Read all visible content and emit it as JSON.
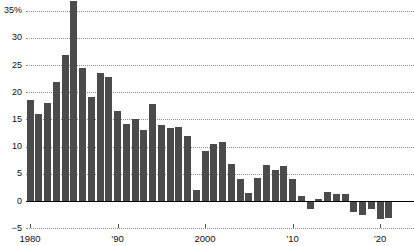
{
  "chart_data": {
    "type": "bar",
    "title": "",
    "subtitle": "",
    "xlabel": "",
    "ylabel": "",
    "ylim": [
      -5,
      36.8
    ],
    "xlim": [
      1979.3,
      2023.2
    ],
    "grid": true,
    "legend": null,
    "bar_color": "#4b4b4b",
    "zero_line_color": "#000000",
    "gridline_color": "#8d8d8d",
    "y_ticks": [
      -5,
      0,
      5,
      10,
      15,
      20,
      25,
      30,
      35
    ],
    "y_tick_labels": [
      "−5",
      "0",
      "5",
      "10",
      "15",
      "20",
      "25",
      "30",
      "35%"
    ],
    "x_ticks": [
      1980,
      1990,
      2000,
      2010,
      2020
    ],
    "x_tick_labels": [
      "1980",
      "’90",
      "2000",
      "’10",
      "’20"
    ],
    "categories": [
      1980,
      1981,
      1982,
      1983,
      1984,
      1985,
      1986,
      1987,
      1988,
      1989,
      1990,
      1991,
      1992,
      1993,
      1994,
      1995,
      1996,
      1997,
      1998,
      1999,
      2000,
      2001,
      2002,
      2003,
      2004,
      2005,
      2006,
      2007,
      2008,
      2009,
      2010,
      2011,
      2012,
      2013,
      2014,
      2015,
      2016,
      2017,
      2018,
      2019,
      2020,
      2021,
      2022
    ],
    "values": [
      18.6,
      16.0,
      18.0,
      21.8,
      26.8,
      36.7,
      24.4,
      19.2,
      23.5,
      22.8,
      16.5,
      14.2,
      15.1,
      13.0,
      17.8,
      14.0,
      13.5,
      13.6,
      11.9,
      2.0,
      9.2,
      10.4,
      10.8,
      6.8,
      4.0,
      1.5,
      4.3,
      6.6,
      5.7,
      6.5,
      4.0,
      0.9,
      -1.4,
      0.3,
      1.7,
      1.2,
      1.3,
      -2.0,
      -2.5,
      -1.5,
      -3.4,
      -3.1,
      -0.2
    ]
  }
}
